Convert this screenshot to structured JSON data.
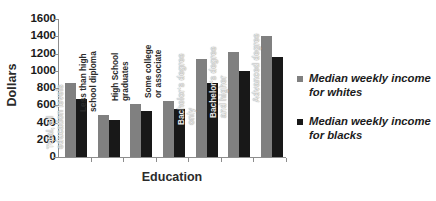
{
  "chart_data": {
    "type": "bar",
    "title": "",
    "xlabel": "Education",
    "ylabel": "Dollars",
    "ylim": [
      0,
      1600
    ],
    "ytick_labels": [
      "1600",
      "1400",
      "1200",
      "1000",
      "800",
      "600",
      "400",
      "200",
      "0"
    ],
    "ytick_values": [
      1600,
      1400,
      1200,
      1000,
      800,
      600,
      400,
      200,
      0
    ],
    "grid": false,
    "legend_position": "right",
    "categories": [
      "Total, all\neducation levels",
      "Less than high\nschool diploma",
      "High School\ngraduates",
      "Some college\nor associate",
      "Bachelor's degree\nonly",
      "Bachelor's degree\nand higher",
      "Advanced degree"
    ],
    "series": [
      {
        "name": "Median weekly income\nfor whites",
        "color": "#808080",
        "values": [
          855,
          490,
          615,
          650,
          1140,
          1220,
          1400
        ]
      },
      {
        "name": "Median weekly income\nfor blacks",
        "color": "#181818",
        "values": [
          670,
          425,
          530,
          555,
          855,
          995,
          1155
        ]
      }
    ]
  }
}
